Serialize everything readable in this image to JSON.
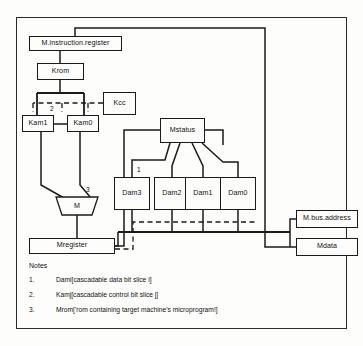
{
  "diagram": {
    "blocks": {
      "minstr": "M.instruction.register",
      "krom": "Krom",
      "kcc": "Kcc",
      "kam1": "Kam1",
      "kam0": "Kam0",
      "m": "M",
      "mregister": "Mregister",
      "mstatus": "Mstatus",
      "dam3": "Dam3",
      "dam2": "Dam2",
      "dam1": "Dam1",
      "dam0": "Dam0",
      "mbusaddress": "M.bus.address",
      "mdata": "Mdata"
    },
    "tags": {
      "tag1": "1",
      "tag2": "2",
      "tag3": "3"
    }
  },
  "notes": {
    "heading": "Notes",
    "items": [
      {
        "num": "1.",
        "text": "Dami[cascadable data bit slice i]"
      },
      {
        "num": "2.",
        "text": "Kamj[cascadable control bit slice j]"
      },
      {
        "num": "3.",
        "text": "Mrom['rom containing target machine's microprogram!]"
      }
    ]
  },
  "colors": {
    "line": "#1a1a1a",
    "frame": "#2a2a2a",
    "background": "#fdfdfc"
  }
}
